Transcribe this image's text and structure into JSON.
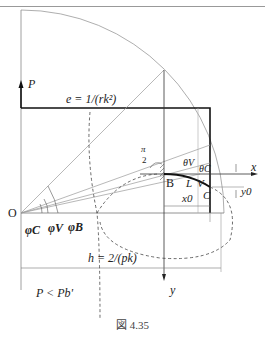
{
  "header": {
    "text": "第 4 章  梁的屈曲与后屈曲"
  },
  "figure": {
    "caption": "図 4.35",
    "labels": {
      "P": "P",
      "e_formula": "e = 1/(rk²)",
      "pi_over_2_num": "π",
      "pi_over_2_den": "2",
      "theta_V": "θV",
      "theta_C": "θC",
      "x_axis": "x",
      "y_axis": "y",
      "B": "B",
      "L": "L",
      "V": "V",
      "C": "C",
      "x0": "x0",
      "y0": "y0",
      "O": "O",
      "phi_C": "φC",
      "phi_V": "φV",
      "phi_B": "φB",
      "h_formula": "h = 2/(pk)",
      "condition": "P < Pb'"
    }
  }
}
